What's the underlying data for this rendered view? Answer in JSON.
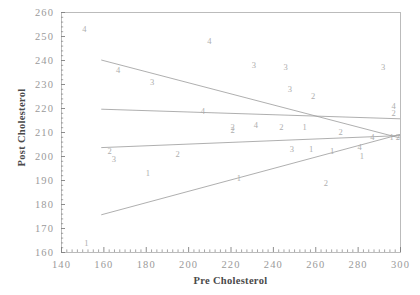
{
  "chart_data": {
    "type": "scatter",
    "title": "",
    "xlabel": "Pre Cholesterol",
    "ylabel": "Post Cholesterol",
    "xlim": [
      140,
      300
    ],
    "ylim": [
      160,
      260
    ],
    "xticks": [
      140,
      160,
      180,
      200,
      220,
      240,
      260,
      280,
      300
    ],
    "yticks": [
      160,
      170,
      180,
      190,
      200,
      210,
      220,
      230,
      240,
      250,
      260
    ],
    "grid": false,
    "legend": null,
    "point_marker": "group-digit-label",
    "colors": {
      "axis": "#808080",
      "tick_label": "#9a9a9a",
      "axis_title": "#4a4a4a",
      "point_label": "#aeaeae",
      "fit_line": "#9a9a9a",
      "frame": "#b4b4b4"
    },
    "points": [
      {
        "x": 151,
        "y": 253,
        "group": "4"
      },
      {
        "x": 210,
        "y": 248,
        "group": "4"
      },
      {
        "x": 167,
        "y": 236,
        "group": "4"
      },
      {
        "x": 231,
        "y": 238,
        "group": "3"
      },
      {
        "x": 246,
        "y": 237,
        "group": "3"
      },
      {
        "x": 292,
        "y": 237,
        "group": "3"
      },
      {
        "x": 183,
        "y": 231,
        "group": "3"
      },
      {
        "x": 248,
        "y": 228,
        "group": "3"
      },
      {
        "x": 259,
        "y": 225,
        "group": "2"
      },
      {
        "x": 297,
        "y": 221,
        "group": "4"
      },
      {
        "x": 297,
        "y": 218,
        "group": "2"
      },
      {
        "x": 207,
        "y": 219,
        "group": "4"
      },
      {
        "x": 221,
        "y": 212,
        "group": "2"
      },
      {
        "x": 232,
        "y": 213,
        "group": "4"
      },
      {
        "x": 244,
        "y": 212,
        "group": "2"
      },
      {
        "x": 255,
        "y": 212,
        "group": "1"
      },
      {
        "x": 221,
        "y": 211,
        "group": "2"
      },
      {
        "x": 272,
        "y": 210,
        "group": "2"
      },
      {
        "x": 287,
        "y": 208,
        "group": "4"
      },
      {
        "x": 296,
        "y": 208,
        "group": "1"
      },
      {
        "x": 299,
        "y": 208,
        "group": "2"
      },
      {
        "x": 163,
        "y": 202,
        "group": "2"
      },
      {
        "x": 165,
        "y": 199,
        "group": "3"
      },
      {
        "x": 195,
        "y": 201,
        "group": "2"
      },
      {
        "x": 249,
        "y": 203,
        "group": "3"
      },
      {
        "x": 258,
        "y": 203,
        "group": "1"
      },
      {
        "x": 268,
        "y": 202,
        "group": "1"
      },
      {
        "x": 281,
        "y": 204,
        "group": "4"
      },
      {
        "x": 282,
        "y": 200,
        "group": "1"
      },
      {
        "x": 181,
        "y": 193,
        "group": "1"
      },
      {
        "x": 224,
        "y": 191,
        "group": "1"
      },
      {
        "x": 265,
        "y": 189,
        "group": "2"
      },
      {
        "x": 152,
        "y": 164,
        "group": "1"
      }
    ],
    "fit_lines": [
      {
        "name": "line-group-a",
        "x1": 159,
        "y1": 240,
        "x2": 300,
        "y2": 207.5
      },
      {
        "name": "line-group-b",
        "x1": 159,
        "y1": 219.5,
        "x2": 300,
        "y2": 215.5
      },
      {
        "name": "line-group-c",
        "x1": 159,
        "y1": 203.5,
        "x2": 300,
        "y2": 208.5
      },
      {
        "name": "line-group-d",
        "x1": 159,
        "y1": 175.5,
        "x2": 300,
        "y2": 209
      }
    ]
  }
}
